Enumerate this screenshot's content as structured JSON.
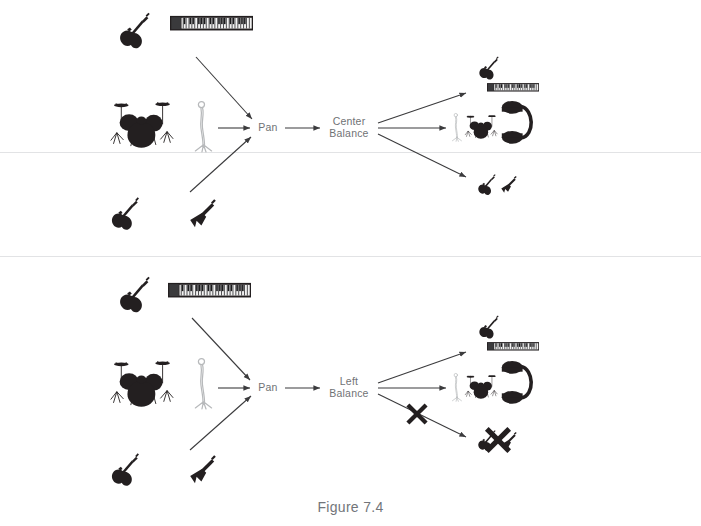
{
  "figure": {
    "caption": "Figure 7.4",
    "caption_color": "#72757a",
    "background_color": "#ffffff",
    "ink_color": "#231f20",
    "label_color": "#6f7275",
    "arrow_color": "#3b3b3d",
    "faint_line_color": "#e2e3e5",
    "width": 701,
    "height": 526
  },
  "diagrams": [
    {
      "id": "top",
      "name": "center-balance-diagram",
      "process_label": "Pan",
      "balance_label": "Center\nBalance",
      "sources": [
        {
          "name": "electric-guitar-icon",
          "label": "electric guitar"
        },
        {
          "name": "keyboard-icon",
          "label": "keyboard"
        },
        {
          "name": "drum-kit-icon",
          "label": "drum kit"
        },
        {
          "name": "microphone-stand-icon",
          "label": "microphone stand"
        },
        {
          "name": "bass-guitar-icon",
          "label": "bass guitar"
        },
        {
          "name": "flying-v-guitar-icon",
          "label": "flying V guitar"
        }
      ],
      "outputs": [
        {
          "name": "output-top-guitar-keyboard",
          "label": "guitar and keyboard",
          "muted": false
        },
        {
          "name": "output-center-drums-mic-headphones",
          "label": "microphone, drums, headphones",
          "muted": false
        },
        {
          "name": "output-bottom-guitars",
          "label": "guitars",
          "muted": false
        }
      ]
    },
    {
      "id": "bottom",
      "name": "left-balance-diagram",
      "process_label": "Pan",
      "balance_label": "Left\nBalance",
      "sources": [
        {
          "name": "electric-guitar-icon",
          "label": "electric guitar"
        },
        {
          "name": "keyboard-icon",
          "label": "keyboard"
        },
        {
          "name": "drum-kit-icon",
          "label": "drum kit"
        },
        {
          "name": "microphone-stand-icon",
          "label": "microphone stand"
        },
        {
          "name": "bass-guitar-icon",
          "label": "bass guitar"
        },
        {
          "name": "flying-v-guitar-icon",
          "label": "flying V guitar"
        }
      ],
      "outputs": [
        {
          "name": "output-top-guitar-keyboard",
          "label": "guitar and keyboard",
          "muted": false
        },
        {
          "name": "output-center-drums-mic-headphones",
          "label": "microphone, drums, headphones",
          "muted": false
        },
        {
          "name": "output-bottom-guitars",
          "label": "guitars",
          "muted": true,
          "mute_marks": 2
        }
      ]
    }
  ]
}
